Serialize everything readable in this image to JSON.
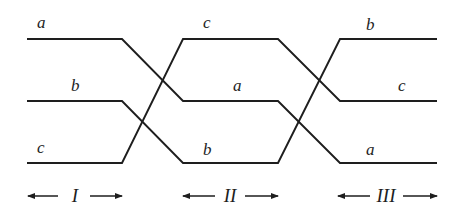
{
  "diagram": {
    "type": "strand-permutation",
    "levels_y": [
      39,
      101,
      163
    ],
    "strands": [
      {
        "name": "a",
        "positions": [
          "top",
          "middle",
          "bottom"
        ]
      },
      {
        "name": "b",
        "positions": [
          "middle",
          "bottom",
          "top"
        ]
      },
      {
        "name": "c",
        "positions": [
          "bottom",
          "top",
          "middle"
        ]
      }
    ],
    "sections": [
      {
        "label": "I",
        "labels": {
          "top": "a",
          "middle": "b",
          "bottom": "c"
        }
      },
      {
        "label": "II",
        "labels": {
          "top": "c",
          "middle": "a",
          "bottom": "b"
        }
      },
      {
        "label": "III",
        "labels": {
          "top": "b",
          "middle": "c",
          "bottom": "a"
        }
      }
    ]
  }
}
